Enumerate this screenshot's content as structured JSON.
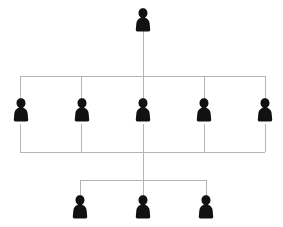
{
  "diagram": {
    "type": "org-chart",
    "background_color": "#ffffff",
    "connector_color": "#b5b5b5",
    "node_color": "#111111",
    "node_icon": "person-silhouette-icon",
    "canvas": {
      "width": 283,
      "height": 227
    },
    "levels": [
      {
        "name": "top-level",
        "index": 0,
        "node_count": 1,
        "nodes": [
          {
            "id": "node-top-1",
            "label": "",
            "icon": "person-silhouette-icon",
            "cx": 143,
            "cy": 20
          }
        ]
      },
      {
        "name": "middle-level",
        "index": 1,
        "node_count": 5,
        "nodes": [
          {
            "id": "node-mid-1",
            "label": "",
            "icon": "person-silhouette-icon",
            "cx": 21,
            "cy": 110
          },
          {
            "id": "node-mid-2",
            "label": "",
            "icon": "person-silhouette-icon",
            "cx": 82,
            "cy": 110
          },
          {
            "id": "node-mid-3",
            "label": "",
            "icon": "person-silhouette-icon",
            "cx": 143,
            "cy": 110
          },
          {
            "id": "node-mid-4",
            "label": "",
            "icon": "person-silhouette-icon",
            "cx": 204,
            "cy": 110
          },
          {
            "id": "node-mid-5",
            "label": "",
            "icon": "person-silhouette-icon",
            "cx": 265,
            "cy": 110
          }
        ]
      },
      {
        "name": "bottom-level",
        "index": 2,
        "node_count": 3,
        "nodes": [
          {
            "id": "node-bot-1",
            "label": "",
            "icon": "person-silhouette-icon",
            "cx": 80,
            "cy": 207
          },
          {
            "id": "node-bot-2",
            "label": "",
            "icon": "person-silhouette-icon",
            "cx": 143,
            "cy": 207
          },
          {
            "id": "node-bot-3",
            "label": "",
            "icon": "person-silhouette-icon",
            "cx": 206,
            "cy": 207
          }
        ]
      }
    ],
    "connectors": [
      {
        "id": "trunk-top",
        "orientation": "vertical",
        "x": 143,
        "y1": 30,
        "y2": 76
      },
      {
        "id": "bus-upper",
        "orientation": "horizontal",
        "y": 76,
        "x1": 20,
        "x2": 265
      },
      {
        "id": "drop-mid-1",
        "orientation": "vertical",
        "x": 20,
        "y1": 76,
        "y2": 99
      },
      {
        "id": "drop-mid-2",
        "orientation": "vertical",
        "x": 81,
        "y1": 76,
        "y2": 99
      },
      {
        "id": "drop-mid-3",
        "orientation": "vertical",
        "x": 143,
        "y1": 76,
        "y2": 99
      },
      {
        "id": "drop-mid-4",
        "orientation": "vertical",
        "x": 204,
        "y1": 76,
        "y2": 99
      },
      {
        "id": "drop-mid-5",
        "orientation": "vertical",
        "x": 265,
        "y1": 76,
        "y2": 99
      },
      {
        "id": "riser-mid-1",
        "orientation": "vertical",
        "x": 20,
        "y1": 124,
        "y2": 152
      },
      {
        "id": "riser-mid-2",
        "orientation": "vertical",
        "x": 81,
        "y1": 124,
        "y2": 152
      },
      {
        "id": "riser-mid-3",
        "orientation": "vertical",
        "x": 143,
        "y1": 124,
        "y2": 152
      },
      {
        "id": "riser-mid-4",
        "orientation": "vertical",
        "x": 204,
        "y1": 124,
        "y2": 152
      },
      {
        "id": "riser-mid-5",
        "orientation": "vertical",
        "x": 265,
        "y1": 124,
        "y2": 152
      },
      {
        "id": "bus-lower",
        "orientation": "horizontal",
        "y": 152,
        "x1": 20,
        "x2": 265
      },
      {
        "id": "trunk-bottom",
        "orientation": "vertical",
        "x": 143,
        "y1": 152,
        "y2": 180
      },
      {
        "id": "bus-bottom",
        "orientation": "horizontal",
        "y": 180,
        "x1": 80,
        "x2": 206
      },
      {
        "id": "drop-bot-1",
        "orientation": "vertical",
        "x": 80,
        "y1": 180,
        "y2": 196
      },
      {
        "id": "drop-bot-2",
        "orientation": "vertical",
        "x": 143,
        "y1": 180,
        "y2": 196
      },
      {
        "id": "drop-bot-3",
        "orientation": "vertical",
        "x": 206,
        "y1": 180,
        "y2": 196
      }
    ]
  }
}
